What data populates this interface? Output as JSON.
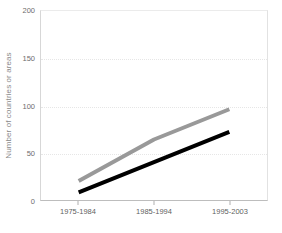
{
  "chart_data": {
    "type": "line",
    "title": "",
    "xlabel": "",
    "ylabel": "Number of countries or areas",
    "categories": [
      "1975-1984",
      "1985-1994",
      "1995-2003"
    ],
    "ylim": [
      0,
      200
    ],
    "yticks": [
      0,
      50,
      100,
      150,
      200
    ],
    "grid": true,
    "legend": "none",
    "series": [
      {
        "name": "gray-series",
        "color": "#999999",
        "values": [
          20,
          64,
          96
        ]
      },
      {
        "name": "black-series",
        "color": "#000000",
        "values": [
          8,
          40,
          72
        ]
      }
    ]
  }
}
